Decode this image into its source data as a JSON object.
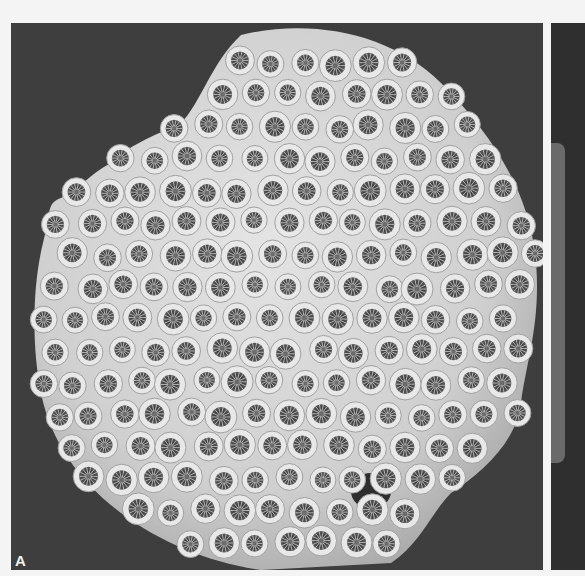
{
  "figure": {
    "panels": [
      {
        "id": "A",
        "label": "A",
        "subject": "coral colony (massive, with circular corallites)"
      },
      {
        "id": "B",
        "label": "",
        "subject": "adjacent panel (partially visible)"
      }
    ],
    "colors": {
      "page_background": "#f4f4f4",
      "panel_background": "#3e3e3e",
      "coral_body": "#d9d9d9",
      "corallite_ring": "#e6e6e6",
      "corallite_center": "#4a4a4a"
    }
  }
}
